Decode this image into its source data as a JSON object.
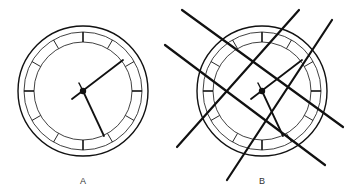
{
  "figure": {
    "panels": [
      {
        "id": "A",
        "label": "A",
        "description": "Clock face unobstructed",
        "time_shown": "approx. 5:10",
        "obstruction_lines": 0
      },
      {
        "id": "B",
        "label": "B",
        "description": "Same clock face overlaid with four crossing thick lines",
        "time_shown": "approx. 5:10",
        "obstruction_lines": 4
      }
    ],
    "colors": {
      "stroke": "#111111",
      "background": "#ffffff",
      "label": "#333333"
    }
  }
}
